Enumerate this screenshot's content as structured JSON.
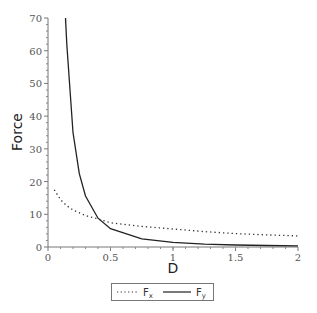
{
  "chart_data": {
    "type": "line",
    "title": "",
    "xlabel": "D",
    "ylabel": "Force",
    "xlim": [
      0,
      2
    ],
    "ylim": [
      0,
      70
    ],
    "grid": false,
    "legend_position": "bottom",
    "x_ticks": [
      "0",
      "0.5",
      "1",
      "1.5",
      "2"
    ],
    "y_ticks": [
      "0",
      "10",
      "20",
      "30",
      "40",
      "50",
      "60",
      "70"
    ],
    "x": [
      0.05,
      0.1,
      0.15,
      0.2,
      0.3,
      0.4,
      0.5,
      0.75,
      1.0,
      1.25,
      1.5,
      1.75,
      2.0
    ],
    "series": [
      {
        "name": "Fx",
        "style": "dotted",
        "color": "#333333",
        "x": [
          0.05,
          0.1,
          0.15,
          0.2,
          0.3,
          0.4,
          0.5,
          0.75,
          1.0,
          1.25,
          1.5,
          1.75,
          2.0
        ],
        "values": [
          17.5,
          14.5,
          12.6,
          11.3,
          9.6,
          8.6,
          7.4,
          6.3,
          5.5,
          4.7,
          4.1,
          3.7,
          3.4
        ]
      },
      {
        "name": "Fy",
        "style": "solid",
        "color": "#222222",
        "x": [
          0.14,
          0.15,
          0.2,
          0.25,
          0.3,
          0.4,
          0.5,
          0.75,
          1.0,
          1.25,
          1.5,
          1.75,
          2.0
        ],
        "values": [
          70,
          62,
          35,
          22.4,
          15.6,
          8.8,
          5.6,
          2.5,
          1.4,
          0.9,
          0.6,
          0.45,
          0.35
        ]
      }
    ]
  },
  "legend": {
    "entries": [
      {
        "label": "F",
        "sub": "x",
        "style": "dotted"
      },
      {
        "label": "F",
        "sub": "y",
        "style": "solid"
      }
    ]
  }
}
